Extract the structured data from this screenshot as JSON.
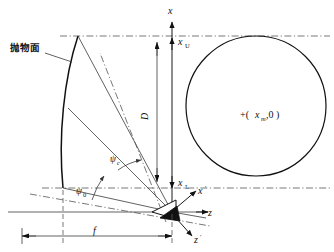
{
  "figure": {
    "type": "technical-diagram",
    "background_color": "#ffffff",
    "line_color": "#111111",
    "construction_line_color": "#555555"
  },
  "labels": {
    "surface_name": "抛物面",
    "axis_x": "x",
    "axis_z": "z",
    "axis_x_prime": "x",
    "axis_z_prime": "z",
    "prime_mark": "′",
    "x_upper": "x",
    "x_upper_sub": "U",
    "x_lower": "x",
    "x_lower_sub": "L",
    "aperture": "D",
    "focal_length": "f",
    "angle_c": "ψ",
    "angle_c_sub": "c",
    "angle_0": "ψ",
    "angle_0_sub": "0",
    "point_marker": "+(",
    "point_x": "x",
    "point_x_sub": "m",
    "point_rest": ",0 )"
  },
  "geometry": {
    "origin": {
      "x": 172,
      "y": 212
    },
    "vertical_axis_x": 172,
    "vertical_axis_top_y": 14,
    "upper_rim_y": 36,
    "lower_rim_y": 188,
    "parabola_top": {
      "x": 78,
      "y": 36
    },
    "parabola_bottom": {
      "x": 63,
      "y": 188
    },
    "focal_dimension_y": 236,
    "focal_dimension_left_x": 22,
    "aperture_dim_x": 157,
    "circle": {
      "cx": 256,
      "cy": 106,
      "r": 70
    },
    "point_marker_pos": {
      "x": 245,
      "y": 118
    }
  }
}
